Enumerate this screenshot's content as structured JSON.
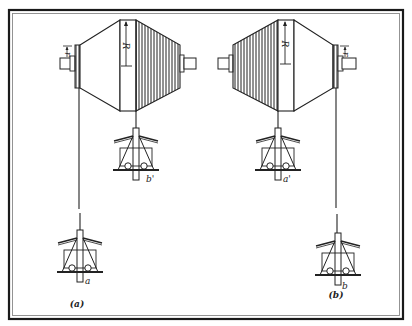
{
  "figure": {
    "panels": [
      {
        "id": "a",
        "caption": "(a)",
        "radius_label": "R",
        "small_radius_label": "r",
        "upper_stand_label": "b'",
        "lower_stand_label": "a"
      },
      {
        "id": "b",
        "caption": "(b)",
        "radius_label": "R",
        "small_radius_label": "r",
        "upper_stand_label": "a'",
        "lower_stand_label": "b"
      }
    ],
    "colors": {
      "line": "#222222",
      "frame_outer": "#1a1a1a",
      "frame_inner": "#888888",
      "background": "#ffffff"
    }
  }
}
